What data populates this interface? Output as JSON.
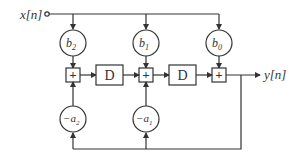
{
  "diagram": {
    "input": {
      "label": "x[n]",
      "var": "x",
      "index": "n"
    },
    "output": {
      "label": "y[n]",
      "var": "y",
      "index": "n"
    },
    "feedforward_gains": [
      {
        "label": "b2",
        "sym": "b",
        "sub": "2"
      },
      {
        "label": "b1",
        "sym": "b",
        "sub": "1"
      },
      {
        "label": "b0",
        "sym": "b",
        "sub": "0"
      }
    ],
    "feedback_gains": [
      {
        "label": "-a2",
        "sym": "−a",
        "sub": "2"
      },
      {
        "label": "-a1",
        "sym": "−a",
        "sub": "1"
      }
    ],
    "delays": [
      {
        "label": "D"
      },
      {
        "label": "D"
      }
    ],
    "adders": [
      {
        "symbol": "+"
      },
      {
        "symbol": "+"
      },
      {
        "symbol": "+"
      }
    ],
    "colors": {
      "stroke": "#333333",
      "background": "#ffffff"
    }
  }
}
